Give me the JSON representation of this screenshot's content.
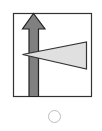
{
  "option": {
    "figure": {
      "frame_color": "#333333",
      "arrow": {
        "direction": "up",
        "fill": "#808080",
        "stroke": "#222222"
      },
      "triangle": {
        "direction": "left",
        "fill": "#e0e0e0",
        "stroke": "#333333"
      }
    },
    "radio": {
      "selected": false,
      "border_color": "#bdbdbd"
    }
  }
}
